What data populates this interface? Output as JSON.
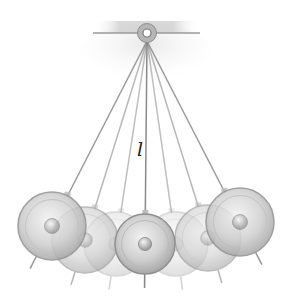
{
  "figure": {
    "length_label": "l",
    "pivot": {
      "x": 147,
      "y": 33,
      "bar_left": 93,
      "bar_right": 200
    },
    "bobs": [
      {
        "x": 52,
        "y": 226,
        "r": 34,
        "opacity": 0.85
      },
      {
        "x": 85,
        "y": 240,
        "r": 33,
        "opacity": 0.6
      },
      {
        "x": 116,
        "y": 244,
        "r": 32,
        "opacity": 0.35
      },
      {
        "x": 145,
        "y": 244,
        "r": 30,
        "opacity": 1.0
      },
      {
        "x": 176,
        "y": 244,
        "r": 32,
        "opacity": 0.35
      },
      {
        "x": 208,
        "y": 238,
        "r": 33,
        "opacity": 0.6
      },
      {
        "x": 240,
        "y": 222,
        "r": 34,
        "opacity": 0.85
      }
    ],
    "colors": {
      "string": "#8a8a8a",
      "bob_fill": "#c9c9c9",
      "bob_edge": "#8f8f8f",
      "pivot": "#b5b5b5",
      "bar": "#9a9a9a"
    }
  }
}
